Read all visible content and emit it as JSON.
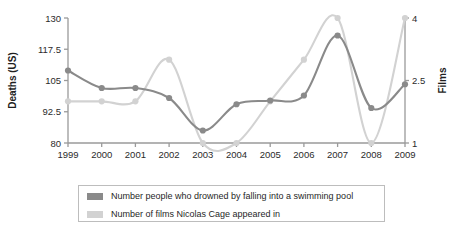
{
  "chart_data": {
    "type": "line",
    "title": "",
    "x": [
      1999,
      2000,
      2001,
      2002,
      2003,
      2004,
      2005,
      2006,
      2007,
      2008,
      2009
    ],
    "categories": [
      "1999",
      "2000",
      "2001",
      "2002",
      "2003",
      "2004",
      "2005",
      "2006",
      "2007",
      "2008",
      "2009"
    ],
    "series": [
      {
        "name": "Number people who drowned by falling into a swimming pool",
        "axis": "left",
        "color": "#8a8a8a",
        "values": [
          109,
          102,
          102,
          98,
          85,
          95.5,
          97,
          99,
          123,
          94,
          103.5
        ]
      },
      {
        "name": "Number of films Nicolas Cage appeared in",
        "axis": "right",
        "color": "#d2d2d2",
        "values": [
          2,
          2,
          2,
          3,
          1,
          1,
          2,
          3,
          4,
          1,
          4
        ]
      }
    ],
    "xlabel": "",
    "ylabel": "Deaths (US)",
    "y2label": "Films",
    "ylim": [
      80,
      130
    ],
    "y2lim": [
      1,
      4
    ],
    "yticks": [
      "80",
      "92.5",
      "105",
      "117.5",
      "130"
    ],
    "y2ticks": [
      "1",
      "2.5",
      "4"
    ],
    "grid": false,
    "legend_position": "bottom"
  },
  "axes": {
    "left_title": "Deaths (US)",
    "right_title": "Films",
    "left_ticks": [
      "130",
      "117.5",
      "105",
      "92.5",
      "80"
    ],
    "right_ticks": [
      "4",
      "2.5",
      "1"
    ],
    "x_ticks": [
      "1999",
      "2000",
      "2001",
      "2002",
      "2003",
      "2004",
      "2005",
      "2006",
      "2007",
      "2008",
      "2009"
    ]
  },
  "legend": {
    "items": [
      {
        "label": "Number people who drowned by falling into a swimming pool",
        "color": "#8a8a8a"
      },
      {
        "label": "Number of films Nicolas Cage appeared in",
        "color": "#d2d2d2"
      }
    ]
  },
  "colors": {
    "deaths_series": "#8a8a8a",
    "films_series": "#d2d2d2",
    "axis": "#9a9a9a",
    "text": "#1f1f1f"
  }
}
